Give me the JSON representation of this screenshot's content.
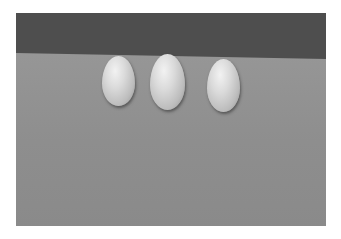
{
  "scene": {
    "description": "Three eggs on a grey surface against a dark grey background",
    "background_color": "#4e4e4e",
    "surface_color": "#8f8f8f",
    "eggs": [
      {
        "label": "egg-1",
        "x": 86,
        "y": 43,
        "w": 33,
        "h": 50
      },
      {
        "label": "egg-2",
        "x": 134,
        "y": 41,
        "w": 35,
        "h": 56
      },
      {
        "label": "egg-3",
        "x": 191,
        "y": 46,
        "w": 33,
        "h": 53
      }
    ]
  }
}
